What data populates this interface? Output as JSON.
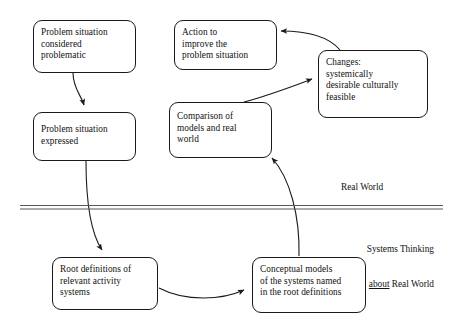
{
  "diagram": {
    "background_color": "#ffffff",
    "line_color": "#1a1a1a",
    "text_color": "#111111",
    "nodes": [
      {
        "id": "problem-situation-considered-problematic",
        "label": "Problem situation considered problematic",
        "lines": [
          "Problem situation",
          "considered",
          "problematic"
        ]
      },
      {
        "id": "problem-situation-expressed",
        "label": "Problem situation expressed",
        "lines": [
          "Problem situation",
          "expressed"
        ]
      },
      {
        "id": "action-to-improve-the-problem-situation",
        "label": "Action to improve the problem situation",
        "lines": [
          "Action to",
          "improve the",
          "problem situation"
        ]
      },
      {
        "id": "comparison-of-models-and-real-world",
        "label": "Comparison of models and real world",
        "lines": [
          "Comparison of",
          "models and real",
          "world"
        ]
      },
      {
        "id": "changes-systemically-desirable-culturally-feasible",
        "label": "Changes: systemically desirable culturally feasible",
        "lines": [
          "Changes:",
          "systemically",
          "desirable culturally",
          "feasible"
        ]
      },
      {
        "id": "root-definitions-of-relevant-activity-systems",
        "label": "Root definitions of relevant activity systems",
        "lines": [
          "Root definitions of",
          "relevant activity",
          "systems"
        ]
      },
      {
        "id": "conceptual-models-of-the-systems-named-in-the-root-definitions",
        "label": "Conceptual models of the systems named in the root definitions",
        "lines": [
          "Conceptual models",
          "of the systems named",
          "in the root definitions"
        ]
      }
    ],
    "zones": {
      "real_world": "Real World",
      "systems_thinking_line1": "Systems Thinking",
      "systems_thinking_about": "about",
      "systems_thinking_line2_rest": " Real World"
    }
  }
}
